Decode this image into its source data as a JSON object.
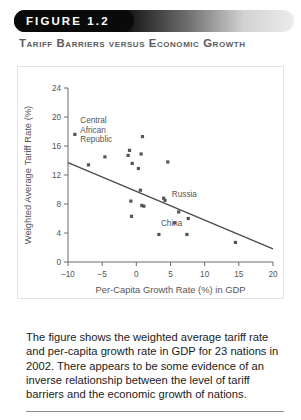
{
  "banner": {
    "figure_label": "FIGURE 1.2"
  },
  "figure": {
    "title": "Tariff Barriers versus Economic Growth",
    "caption": "The figure shows the weighted average tariff rate and per-capita growth rate in GDP for 23 nations in 2002. There appears to be some evidence of an inverse relationship between the level of tariff barriers and the economic growth of nations."
  },
  "chart_data": {
    "type": "scatter",
    "title": "Tariff Barriers versus Economic Growth",
    "xlabel": "Per-Capita Growth Rate (%) in GDP",
    "ylabel": "Weighted Average Tariff Rate (%)",
    "xlim": [
      -10,
      20
    ],
    "ylim": [
      0,
      24
    ],
    "xticks": [
      -10,
      -5,
      0,
      5,
      10,
      15,
      20
    ],
    "yticks": [
      0,
      4,
      8,
      12,
      16,
      20,
      24
    ],
    "xtick_labels": [
      "–10",
      "–5",
      "0",
      "5",
      "10",
      "15",
      "20"
    ],
    "ytick_labels": [
      "0",
      "4",
      "8",
      "12",
      "16",
      "20",
      "24"
    ],
    "grid": false,
    "legend": false,
    "n_points": 23,
    "points": [
      {
        "x": -9.0,
        "y": 17.6,
        "label": "Central African Republic"
      },
      {
        "x": -7.0,
        "y": 13.4,
        "label": ""
      },
      {
        "x": -4.6,
        "y": 14.5,
        "label": ""
      },
      {
        "x": -1.0,
        "y": 15.4,
        "label": ""
      },
      {
        "x": -1.2,
        "y": 14.7,
        "label": ""
      },
      {
        "x": -0.6,
        "y": 13.6,
        "label": ""
      },
      {
        "x": 0.9,
        "y": 17.3,
        "label": ""
      },
      {
        "x": 0.7,
        "y": 14.9,
        "label": ""
      },
      {
        "x": 0.3,
        "y": 12.9,
        "label": ""
      },
      {
        "x": 0.6,
        "y": 9.9,
        "label": ""
      },
      {
        "x": -0.8,
        "y": 8.4,
        "label": ""
      },
      {
        "x": 0.8,
        "y": 7.8,
        "label": ""
      },
      {
        "x": 1.1,
        "y": 7.7,
        "label": ""
      },
      {
        "x": -0.7,
        "y": 6.3,
        "label": ""
      },
      {
        "x": 4.6,
        "y": 13.8,
        "label": ""
      },
      {
        "x": 4.0,
        "y": 8.8,
        "label": ""
      },
      {
        "x": 4.2,
        "y": 8.5,
        "label": "Russia"
      },
      {
        "x": 6.2,
        "y": 6.9,
        "label": ""
      },
      {
        "x": 7.6,
        "y": 6.0,
        "label": ""
      },
      {
        "x": 5.6,
        "y": 5.4,
        "label": "China"
      },
      {
        "x": 3.3,
        "y": 3.8,
        "label": ""
      },
      {
        "x": 7.4,
        "y": 3.8,
        "label": ""
      },
      {
        "x": 14.5,
        "y": 2.7,
        "label": ""
      }
    ],
    "trendline": {
      "x0": -10,
      "y0": 13.7,
      "x1": 20,
      "y1": 1.8
    },
    "annotations": [
      {
        "text": "Central African Republic",
        "x": -8.5,
        "y": 19.0
      },
      {
        "text": "Russia",
        "x": 5.2,
        "y": 8.9
      },
      {
        "text": "China",
        "x": 3.6,
        "y": 4.9
      }
    ]
  }
}
